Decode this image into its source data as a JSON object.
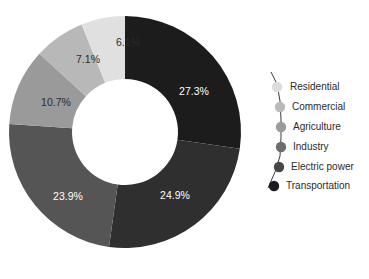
{
  "chart_data": {
    "type": "pie",
    "variant": "donut",
    "title": "",
    "subtitle": "",
    "xlabel": "",
    "ylabel": "",
    "grid": false,
    "legend_position": "right",
    "start_angle_deg": 0,
    "direction": "clockwise",
    "categories": [
      "Transportation",
      "Electric power",
      "Industry",
      "Agriculture",
      "Commercial",
      "Residential"
    ],
    "values": [
      27.3,
      24.9,
      23.9,
      10.7,
      7.1,
      6.1
    ],
    "value_unit": "%",
    "slices": [
      {
        "label": "Transportation",
        "value": 27.3,
        "display": "27.3%",
        "color": "#1c1c1c",
        "label_color": "#ffffff"
      },
      {
        "label": "Electric power",
        "value": 24.9,
        "display": "24.9%",
        "color": "#2f2f2f",
        "label_color": "#ffffff"
      },
      {
        "label": "Industry",
        "value": 23.9,
        "display": "23.9%",
        "color": "#555555",
        "label_color": "#ffffff"
      },
      {
        "label": "Agriculture",
        "value": 10.7,
        "display": "10.7%",
        "color": "#9a9a9a",
        "label_color": "#2b2b2b"
      },
      {
        "label": "Commercial",
        "value": 7.1,
        "display": "7.1%",
        "color": "#b8b8b8",
        "label_color": "#2b2b2b"
      },
      {
        "label": "Residential",
        "value": 6.1,
        "display": "6.1%",
        "color": "#e0e0e0",
        "label_color": "#2b2b2b"
      }
    ]
  },
  "donut": {
    "center_x": 125,
    "center_y": 132,
    "outer_radius": 116,
    "inner_radius": 53,
    "hole_color": "#ffffff",
    "labels": [
      {
        "name": "slice-label-transportation",
        "text": "27.3%",
        "x": 194,
        "y": 92,
        "tone": "light"
      },
      {
        "name": "slice-label-electric-power",
        "text": "24.9%",
        "x": 175,
        "y": 196,
        "tone": "light"
      },
      {
        "name": "slice-label-industry",
        "text": "23.9%",
        "x": 68,
        "y": 197,
        "tone": "light"
      },
      {
        "name": "slice-label-agriculture",
        "text": "10.7%",
        "x": 56,
        "y": 103,
        "tone": "dark"
      },
      {
        "name": "slice-label-commercial",
        "text": "7.1%",
        "x": 88,
        "y": 60,
        "tone": "dark"
      },
      {
        "name": "slice-label-residential",
        "text": "6.1%",
        "x": 128,
        "y": 43,
        "tone": "dark"
      }
    ]
  },
  "legend": {
    "connector_path": "M 271 72 L 277 84 L 280 101 L 281 119 L 281 137 L 280 156 L 275 172 L 268 188",
    "items": [
      {
        "label": "Residential",
        "color": "#dcdcdc",
        "dot_x": 277,
        "dot_y": 87,
        "text_x": 290,
        "text_y": 87,
        "dot_r": 5.2
      },
      {
        "label": "Commercial",
        "color": "#b9b9b9",
        "dot_x": 280,
        "dot_y": 107,
        "text_x": 292,
        "text_y": 107,
        "dot_r": 5.2
      },
      {
        "label": "Agriculture",
        "color": "#9b9b9b",
        "dot_x": 281,
        "dot_y": 127,
        "text_x": 293,
        "text_y": 127,
        "dot_r": 5.2
      },
      {
        "label": "Industry",
        "color": "#6d6d6d",
        "dot_x": 281,
        "dot_y": 147,
        "text_x": 293,
        "text_y": 147,
        "dot_r": 5.2
      },
      {
        "label": "Electric power",
        "color": "#474747",
        "dot_x": 279,
        "dot_y": 167,
        "text_x": 291,
        "text_y": 167,
        "dot_r": 5.2
      },
      {
        "label": "Transportation",
        "color": "#1c1c1c",
        "dot_x": 274,
        "dot_y": 186,
        "text_x": 286,
        "text_y": 186,
        "dot_r": 5.2
      }
    ]
  }
}
